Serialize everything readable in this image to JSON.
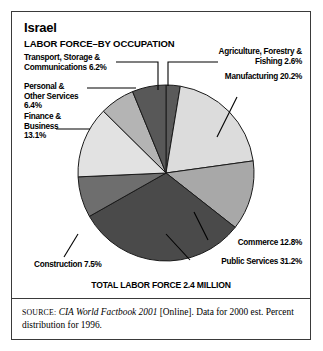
{
  "figure": {
    "title": "Israel",
    "subtitle": "LABOR FORCE–BY OCCUPATION",
    "total_label": "TOTAL LABOR FORCE 2.4 MILLION",
    "source_prefix": "SOURCE:",
    "source_italic": "CIA World Factbook 2001",
    "source_rest": " [Online]. Data for 2000 est. Percent distribution for 1996.",
    "frame_color": "#3a3a3a",
    "background": "#ffffff"
  },
  "labels": {
    "transport": "Transport, Storage &\nCommunications 6.2%",
    "personal": "Personal &\nOther Services\n6.4%",
    "finance": "Finance &\nBusiness\n13.1%",
    "construction": "Construction 7.5%",
    "agriculture": "Agriculture, Forestry &\nFishing 2.6%",
    "manufacturing": "Manufacturing 20.2%",
    "commerce": "Commerce 12.8%",
    "public_services": "Public Services 31.2%"
  },
  "chart_data": {
    "type": "pie",
    "subtitle": "TOTAL LABOR FORCE 2.4 MILLION",
    "unit": "percent",
    "start_angle_deg": 0,
    "direction": "clockwise",
    "total_labor_force": "2.4 million",
    "categories": [
      "Agriculture, Forestry & Fishing",
      "Manufacturing",
      "Commerce",
      "Public Services",
      "Construction",
      "Finance & Business",
      "Personal & Other Services",
      "Transport, Storage & Communications"
    ],
    "values": [
      2.6,
      20.2,
      12.8,
      31.2,
      7.5,
      13.1,
      6.4,
      6.2
    ],
    "colors": [
      "#5a5a5a",
      "#dcdcdc",
      "#a8a8a8",
      "#4a4a4a",
      "#6e6e6e",
      "#e2e2e2",
      "#b4b4b4",
      "#585858"
    ],
    "legend": "callout-labels",
    "grid": false
  }
}
